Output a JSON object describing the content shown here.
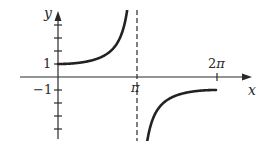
{
  "chart_data": {
    "type": "line",
    "title": "",
    "xlabel": "x",
    "ylabel": "y",
    "x_tick_labels": [
      "π",
      "2π"
    ],
    "y_tick_labels": [
      "1",
      "−1"
    ],
    "y_tick_marks": [
      4,
      3,
      2,
      1,
      -1,
      -2,
      -3,
      -4
    ],
    "vertical_asymptote": {
      "x": "π",
      "style": "dashed"
    },
    "xlim": [
      "0",
      "2π+"
    ],
    "ylim": [
      -4.8,
      5.2
    ],
    "grid": false,
    "legend": "none",
    "series": [
      {
        "name": "left branch",
        "x": [
          "0",
          "π/4",
          "π/2",
          "3π/4",
          "0.9π"
        ],
        "values": [
          1.0,
          1.08,
          1.41,
          2.61,
          6.39
        ]
      },
      {
        "name": "right branch",
        "x": [
          "1.1π",
          "5π/4",
          "3π/2",
          "7π/4",
          "2π"
        ],
        "values": [
          -6.39,
          -2.61,
          -1.41,
          -1.08,
          -1.0
        ]
      }
    ]
  },
  "labels": {
    "y_axis": "y",
    "x_axis": "x",
    "y_one": "1",
    "y_neg_one": "−1",
    "x_pi": "π",
    "x_two_pi_num": "2",
    "x_two_pi_sym": "π"
  },
  "colors": {
    "ink": "#2a2a2a",
    "background": "#ffffff"
  }
}
